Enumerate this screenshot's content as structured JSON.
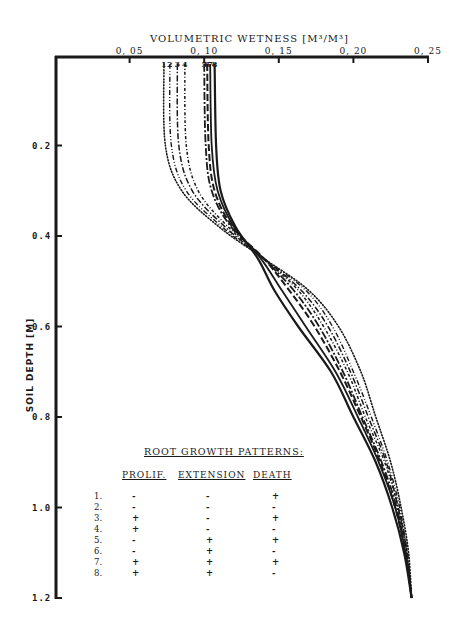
{
  "chart_data": {
    "type": "line",
    "title": "",
    "xlabel": "VOLUMETRIC WETNESS [M³/M³]",
    "ylabel": "SOIL DEPTH [M]",
    "x_axis_position": "top",
    "y_axis_inverted": true,
    "xlim": [
      0.0,
      0.25
    ],
    "ylim": [
      0.0,
      1.2
    ],
    "xticks": [
      "0.05",
      "0.10",
      "0.15",
      "0.20",
      "0.25"
    ],
    "yticks": [
      "0.2",
      "0.4",
      "0.6",
      "0.8",
      "1.0",
      "1.2"
    ],
    "grid": false,
    "series": [
      {
        "name": "1",
        "style": "dotted fine",
        "points": [
          [
            0.073,
            0.02
          ],
          [
            0.074,
            0.2
          ],
          [
            0.085,
            0.3
          ],
          [
            0.11,
            0.38
          ],
          [
            0.14,
            0.45
          ],
          [
            0.17,
            0.52
          ],
          [
            0.19,
            0.6
          ],
          [
            0.205,
            0.7
          ],
          [
            0.215,
            0.8
          ],
          [
            0.225,
            0.9
          ],
          [
            0.232,
            1.0
          ],
          [
            0.237,
            1.1
          ],
          [
            0.239,
            1.2
          ]
        ]
      },
      {
        "name": "2",
        "style": "dash-dot-dot",
        "points": [
          [
            0.077,
            0.02
          ],
          [
            0.078,
            0.2
          ],
          [
            0.088,
            0.3
          ],
          [
            0.112,
            0.38
          ],
          [
            0.14,
            0.45
          ],
          [
            0.168,
            0.52
          ],
          [
            0.186,
            0.6
          ],
          [
            0.2,
            0.7
          ],
          [
            0.212,
            0.8
          ],
          [
            0.223,
            0.9
          ],
          [
            0.231,
            1.0
          ],
          [
            0.236,
            1.1
          ],
          [
            0.239,
            1.2
          ]
        ]
      },
      {
        "name": "3",
        "style": "dash-dot",
        "points": [
          [
            0.082,
            0.02
          ],
          [
            0.083,
            0.2
          ],
          [
            0.092,
            0.3
          ],
          [
            0.114,
            0.38
          ],
          [
            0.14,
            0.45
          ],
          [
            0.165,
            0.52
          ],
          [
            0.183,
            0.6
          ],
          [
            0.198,
            0.7
          ],
          [
            0.21,
            0.8
          ],
          [
            0.222,
            0.9
          ],
          [
            0.23,
            1.0
          ],
          [
            0.236,
            1.1
          ],
          [
            0.239,
            1.2
          ]
        ]
      },
      {
        "name": "4",
        "style": "dash-dot short",
        "points": [
          [
            0.087,
            0.02
          ],
          [
            0.088,
            0.2
          ],
          [
            0.096,
            0.3
          ],
          [
            0.116,
            0.38
          ],
          [
            0.14,
            0.45
          ],
          [
            0.163,
            0.52
          ],
          [
            0.18,
            0.6
          ],
          [
            0.196,
            0.7
          ],
          [
            0.208,
            0.8
          ],
          [
            0.221,
            0.9
          ],
          [
            0.23,
            1.0
          ],
          [
            0.236,
            1.1
          ],
          [
            0.239,
            1.2
          ]
        ]
      },
      {
        "name": "5",
        "style": "dash-dot long",
        "points": [
          [
            0.1,
            0.02
          ],
          [
            0.101,
            0.2
          ],
          [
            0.105,
            0.3
          ],
          [
            0.118,
            0.38
          ],
          [
            0.14,
            0.45
          ],
          [
            0.16,
            0.52
          ],
          [
            0.177,
            0.6
          ],
          [
            0.193,
            0.7
          ],
          [
            0.206,
            0.8
          ],
          [
            0.219,
            0.9
          ],
          [
            0.229,
            1.0
          ],
          [
            0.235,
            1.1
          ],
          [
            0.239,
            1.2
          ]
        ]
      },
      {
        "name": "6",
        "style": "long dash",
        "points": [
          [
            0.102,
            0.02
          ],
          [
            0.103,
            0.2
          ],
          [
            0.107,
            0.3
          ],
          [
            0.119,
            0.38
          ],
          [
            0.14,
            0.45
          ],
          [
            0.157,
            0.52
          ],
          [
            0.174,
            0.6
          ],
          [
            0.191,
            0.7
          ],
          [
            0.205,
            0.8
          ],
          [
            0.218,
            0.9
          ],
          [
            0.228,
            1.0
          ],
          [
            0.235,
            1.1
          ],
          [
            0.239,
            1.2
          ]
        ]
      },
      {
        "name": "7",
        "style": "solid",
        "points": [
          [
            0.104,
            0.02
          ],
          [
            0.105,
            0.2
          ],
          [
            0.109,
            0.3
          ],
          [
            0.12,
            0.38
          ],
          [
            0.138,
            0.45
          ],
          [
            0.152,
            0.52
          ],
          [
            0.168,
            0.6
          ],
          [
            0.188,
            0.7
          ],
          [
            0.203,
            0.8
          ],
          [
            0.217,
            0.9
          ],
          [
            0.228,
            1.0
          ],
          [
            0.235,
            1.1
          ],
          [
            0.239,
            1.2
          ]
        ]
      },
      {
        "name": "8",
        "style": "solid",
        "points": [
          [
            0.107,
            0.02
          ],
          [
            0.108,
            0.2
          ],
          [
            0.111,
            0.3
          ],
          [
            0.121,
            0.38
          ],
          [
            0.136,
            0.45
          ],
          [
            0.147,
            0.52
          ],
          [
            0.163,
            0.6
          ],
          [
            0.185,
            0.7
          ],
          [
            0.2,
            0.8
          ],
          [
            0.215,
            0.9
          ],
          [
            0.226,
            1.0
          ],
          [
            0.234,
            1.1
          ],
          [
            0.239,
            1.2
          ]
        ]
      }
    ],
    "annotations": [
      {
        "text": "1 2 3 4 5 6 7 8",
        "note": "curve number labels at top of each curve"
      }
    ],
    "legend": {
      "title": "ROOT GROWTH PATTERNS:",
      "columns": [
        "PROLIF.",
        "EXTENSION",
        "DEATH"
      ],
      "rows": [
        {
          "id": "1.",
          "prolif": "-",
          "extension": "-",
          "death": "+"
        },
        {
          "id": "2.",
          "prolif": "-",
          "extension": "-",
          "death": "-"
        },
        {
          "id": "3.",
          "prolif": "+",
          "extension": "-",
          "death": "+"
        },
        {
          "id": "4.",
          "prolif": "+",
          "extension": "-",
          "death": "-"
        },
        {
          "id": "5.",
          "prolif": "-",
          "extension": "+",
          "death": "+"
        },
        {
          "id": "6.",
          "prolif": "-",
          "extension": "+",
          "death": "-"
        },
        {
          "id": "7.",
          "prolif": "+",
          "extension": "+",
          "death": "+"
        },
        {
          "id": "8.",
          "prolif": "+",
          "extension": "+",
          "death": "-"
        }
      ],
      "position": "lower-left inside plot"
    }
  },
  "labels": {
    "x_title": "VOLUMETRIC WETNESS [M³/M³]",
    "y_title": "SOIL DEPTH [M]",
    "curve_numbers": [
      "1",
      "2",
      "3",
      "4",
      "5",
      "6",
      "7",
      "8"
    ]
  }
}
